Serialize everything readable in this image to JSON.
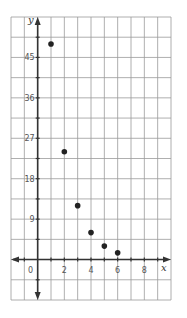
{
  "chart_data": {
    "type": "scatter",
    "title": "",
    "xlabel": "x",
    "ylabel": "y",
    "xlim": [
      -2,
      10
    ],
    "ylim": [
      -9,
      54
    ],
    "grid": true,
    "x_grid_step": 1,
    "y_grid_step": 4.5,
    "x_ticks": [
      0,
      2,
      4,
      6,
      8
    ],
    "x_tick_labels": [
      "0",
      "2",
      "4",
      "6",
      "8"
    ],
    "y_ticks": [
      9,
      18,
      27,
      36,
      45
    ],
    "y_tick_labels": [
      "9",
      "18",
      "27",
      "36",
      "45"
    ],
    "points": [
      {
        "x": 1,
        "y": 48
      },
      {
        "x": 2,
        "y": 24
      },
      {
        "x": 3,
        "y": 12
      },
      {
        "x": 4,
        "y": 6
      },
      {
        "x": 5,
        "y": 3
      },
      {
        "x": 6,
        "y": 1.5
      }
    ],
    "colors": {
      "grid": "#9a9a9a",
      "axis": "#333333",
      "point": "#222222"
    }
  }
}
